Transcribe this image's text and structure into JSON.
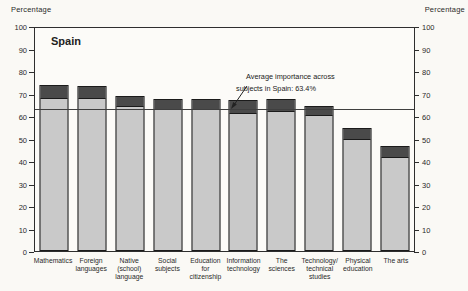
{
  "figure": {
    "axis_title_left": "Percentage",
    "axis_title_right": "Percentage",
    "country_label": "Spain",
    "annotation_line1": "Average importance across",
    "annotation_line2": "subjects in Spain: 63.4%"
  },
  "chart_data": {
    "type": "bar",
    "title": "Spain",
    "subtitle": "Importance of school subjects (stacked light-gray base with dark-gray cap)",
    "categories": [
      "Mathematics",
      "Foreign\nlanguages",
      "Native\n(school)\nlanguage",
      "Social\nsubjects",
      "Education\nfor\ncitizenship",
      "Information\ntechnology",
      "The\nsciences",
      "Technology/\ntechnical\nstudies",
      "Physical\neducation",
      "The arts"
    ],
    "series": [
      {
        "name": "base-segment-light-gray",
        "values": [
          68.5,
          68.5,
          65,
          63.5,
          63.5,
          62,
          62.5,
          61,
          50,
          42
        ]
      },
      {
        "name": "top-cap-dark-gray",
        "values": [
          6,
          5.5,
          4.5,
          4.5,
          4.5,
          5.5,
          5.5,
          4,
          5,
          5
        ]
      }
    ],
    "bar_totals": [
      74.5,
      74,
      69.5,
      68,
      68,
      67.5,
      68,
      65,
      55,
      47
    ],
    "average_line": {
      "value": 63.4,
      "label": "Average importance across subjects in Spain: 63.4%"
    },
    "ylabel": "Percentage",
    "ylim": [
      0,
      100
    ],
    "yticks": [
      0,
      10,
      20,
      30,
      40,
      50,
      60,
      70,
      80,
      90,
      100
    ],
    "grid": false,
    "legend": "none"
  },
  "colors": {
    "background": "#faf9f5",
    "plot_background": "#fcfbf8",
    "bar_light": "#c9c9c9",
    "bar_dark": "#4a4a4a",
    "bar_border": "#1b1b1b",
    "axis": "#2e2e2e",
    "avg_line": "#3f3f3f",
    "text": "#222222"
  }
}
